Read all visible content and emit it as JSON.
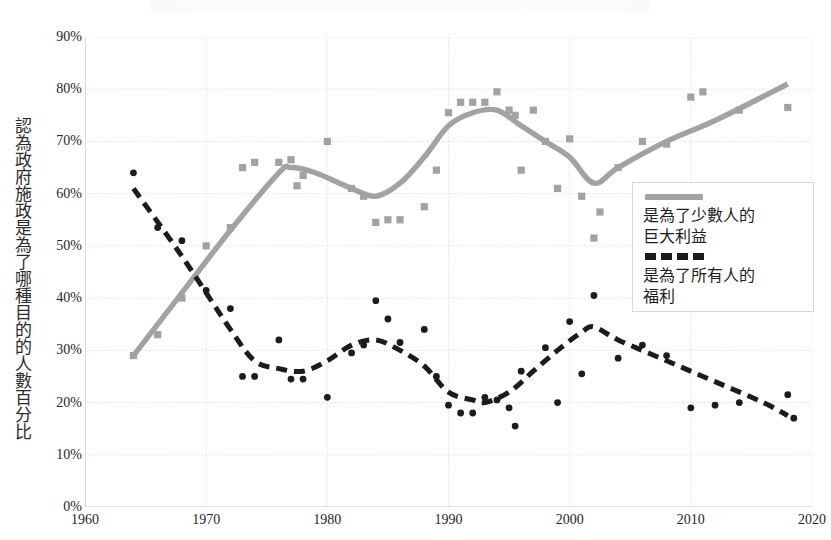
{
  "axis": {
    "y_title": "認為政府施政是為了哪種目的的人數百分比",
    "y_ticks": [
      "90%",
      "80%",
      "70%",
      "60%",
      "50%",
      "40%",
      "30%",
      "20%",
      "10%",
      "0%"
    ],
    "x_ticks": [
      "1960",
      "1970",
      "1980",
      "1990",
      "2000",
      "2010",
      "2020"
    ]
  },
  "legend": {
    "series1_label": "是為了少數人的\n巨大利益",
    "series2_label": "是為了所有人的\n福利",
    "series1_style": "solid",
    "series2_style": "dashed"
  },
  "colors": {
    "series1": "#a2a2a2",
    "series2": "#1c1c1c",
    "grid": "#d9d9d9",
    "axis_text": "#262626",
    "background": "#ffffff"
  },
  "chart_data": {
    "type": "scatter",
    "title": "",
    "xlabel": "",
    "ylabel": "認為政府施政是為了哪種目的的人數百分比",
    "xlim": [
      1960,
      2020
    ],
    "ylim": [
      0,
      90
    ],
    "ytick_values": [
      0,
      10,
      20,
      30,
      40,
      50,
      60,
      70,
      80,
      90
    ],
    "xtick_values": [
      1960,
      1970,
      1980,
      1990,
      2000,
      2010,
      2020
    ],
    "grid": true,
    "legend_position": "right",
    "series": [
      {
        "name": "是為了少數人的巨大利益",
        "style": "solid",
        "marker": "square",
        "color": "#a2a2a2",
        "points": [
          {
            "x": 1964,
            "y": 29
          },
          {
            "x": 1966,
            "y": 33
          },
          {
            "x": 1968,
            "y": 40
          },
          {
            "x": 1970,
            "y": 50
          },
          {
            "x": 1972,
            "y": 53.5
          },
          {
            "x": 1973,
            "y": 65
          },
          {
            "x": 1974,
            "y": 66
          },
          {
            "x": 1976,
            "y": 66
          },
          {
            "x": 1977,
            "y": 66.5
          },
          {
            "x": 1977.5,
            "y": 61.5
          },
          {
            "x": 1978,
            "y": 63.5
          },
          {
            "x": 1980,
            "y": 70
          },
          {
            "x": 1982,
            "y": 61
          },
          {
            "x": 1983,
            "y": 59.5
          },
          {
            "x": 1984,
            "y": 54.5
          },
          {
            "x": 1985,
            "y": 55
          },
          {
            "x": 1986,
            "y": 55
          },
          {
            "x": 1988,
            "y": 57.5
          },
          {
            "x": 1989,
            "y": 64.5
          },
          {
            "x": 1990,
            "y": 75.5
          },
          {
            "x": 1991,
            "y": 77.5
          },
          {
            "x": 1992,
            "y": 77.5
          },
          {
            "x": 1993,
            "y": 77.5
          },
          {
            "x": 1994,
            "y": 79.5
          },
          {
            "x": 1995,
            "y": 76
          },
          {
            "x": 1995.5,
            "y": 75
          },
          {
            "x": 1996,
            "y": 64.5
          },
          {
            "x": 1997,
            "y": 76
          },
          {
            "x": 1998,
            "y": 70
          },
          {
            "x": 1999,
            "y": 61
          },
          {
            "x": 2000,
            "y": 70.5
          },
          {
            "x": 2001,
            "y": 59.5
          },
          {
            "x": 2002,
            "y": 51.5
          },
          {
            "x": 2002.5,
            "y": 56.5
          },
          {
            "x": 2004,
            "y": 65
          },
          {
            "x": 2006,
            "y": 70
          },
          {
            "x": 2008,
            "y": 69.5
          },
          {
            "x": 2010,
            "y": 78.5
          },
          {
            "x": 2011,
            "y": 79.5
          },
          {
            "x": 2014,
            "y": 76
          },
          {
            "x": 2018,
            "y": 76.5
          }
        ],
        "trend": [
          {
            "x": 1964,
            "y": 29
          },
          {
            "x": 1968,
            "y": 41
          },
          {
            "x": 1972,
            "y": 53
          },
          {
            "x": 1976,
            "y": 64
          },
          {
            "x": 1977,
            "y": 65
          },
          {
            "x": 1979,
            "y": 64
          },
          {
            "x": 1982,
            "y": 61
          },
          {
            "x": 1984,
            "y": 59.5
          },
          {
            "x": 1986,
            "y": 62
          },
          {
            "x": 1988,
            "y": 67
          },
          {
            "x": 1990,
            "y": 73
          },
          {
            "x": 1992,
            "y": 75.5
          },
          {
            "x": 1994,
            "y": 76
          },
          {
            "x": 1996,
            "y": 73
          },
          {
            "x": 1998,
            "y": 70
          },
          {
            "x": 2000,
            "y": 67
          },
          {
            "x": 2002,
            "y": 62
          },
          {
            "x": 2004,
            "y": 65
          },
          {
            "x": 2008,
            "y": 70
          },
          {
            "x": 2012,
            "y": 74
          },
          {
            "x": 2018,
            "y": 81
          }
        ]
      },
      {
        "name": "是為了所有人的福利",
        "style": "dashed",
        "marker": "circle",
        "color": "#1c1c1c",
        "points": [
          {
            "x": 1964,
            "y": 64
          },
          {
            "x": 1966,
            "y": 53.5
          },
          {
            "x": 1968,
            "y": 51
          },
          {
            "x": 1970,
            "y": 41.5
          },
          {
            "x": 1972,
            "y": 38
          },
          {
            "x": 1973,
            "y": 25
          },
          {
            "x": 1974,
            "y": 25
          },
          {
            "x": 1976,
            "y": 32
          },
          {
            "x": 1977,
            "y": 24.5
          },
          {
            "x": 1978,
            "y": 24.5
          },
          {
            "x": 1980,
            "y": 21
          },
          {
            "x": 1982,
            "y": 29.5
          },
          {
            "x": 1983,
            "y": 31
          },
          {
            "x": 1984,
            "y": 39.5
          },
          {
            "x": 1985,
            "y": 36
          },
          {
            "x": 1986,
            "y": 31.5
          },
          {
            "x": 1988,
            "y": 34
          },
          {
            "x": 1989,
            "y": 25
          },
          {
            "x": 1990,
            "y": 19.5
          },
          {
            "x": 1991,
            "y": 18
          },
          {
            "x": 1992,
            "y": 18
          },
          {
            "x": 1993,
            "y": 21
          },
          {
            "x": 1994,
            "y": 20.5
          },
          {
            "x": 1995,
            "y": 19
          },
          {
            "x": 1995.5,
            "y": 15.5
          },
          {
            "x": 1996,
            "y": 26
          },
          {
            "x": 1998,
            "y": 30.5
          },
          {
            "x": 1999,
            "y": 20
          },
          {
            "x": 2000,
            "y": 35.5
          },
          {
            "x": 2001,
            "y": 25.5
          },
          {
            "x": 2002,
            "y": 40.5
          },
          {
            "x": 2004,
            "y": 28.5
          },
          {
            "x": 2006,
            "y": 31
          },
          {
            "x": 2008,
            "y": 29
          },
          {
            "x": 2010,
            "y": 19
          },
          {
            "x": 2012,
            "y": 19.5
          },
          {
            "x": 2014,
            "y": 20
          },
          {
            "x": 2018,
            "y": 21.5
          },
          {
            "x": 2018.5,
            "y": 17
          }
        ],
        "trend": [
          {
            "x": 1964,
            "y": 61
          },
          {
            "x": 1968,
            "y": 48
          },
          {
            "x": 1972,
            "y": 34
          },
          {
            "x": 1974,
            "y": 28
          },
          {
            "x": 1976,
            "y": 26.5
          },
          {
            "x": 1978,
            "y": 26
          },
          {
            "x": 1980,
            "y": 28
          },
          {
            "x": 1982,
            "y": 31
          },
          {
            "x": 1984,
            "y": 32
          },
          {
            "x": 1986,
            "y": 30
          },
          {
            "x": 1988,
            "y": 27
          },
          {
            "x": 1990,
            "y": 22
          },
          {
            "x": 1992,
            "y": 20.5
          },
          {
            "x": 1993,
            "y": 20
          },
          {
            "x": 1995,
            "y": 22
          },
          {
            "x": 1997,
            "y": 26
          },
          {
            "x": 1999,
            "y": 30
          },
          {
            "x": 2001,
            "y": 33.5
          },
          {
            "x": 2002,
            "y": 34.5
          },
          {
            "x": 2004,
            "y": 32
          },
          {
            "x": 2008,
            "y": 28
          },
          {
            "x": 2012,
            "y": 24
          },
          {
            "x": 2016,
            "y": 20
          },
          {
            "x": 2018,
            "y": 17.5
          }
        ]
      }
    ]
  }
}
